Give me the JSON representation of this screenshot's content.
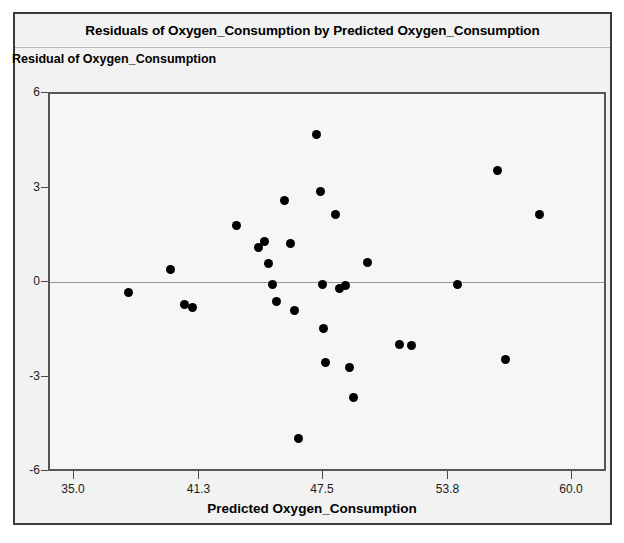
{
  "chart": {
    "title": "Residuals of Oxygen_Consumption by Predicted Oxygen_Consumption",
    "y_caption": "Residual of Oxygen_Consumption",
    "x_caption": "Predicted Oxygen_Consumption"
  },
  "chart_data": {
    "type": "scatter",
    "title": "Residuals of Oxygen_Consumption by Predicted Oxygen_Consumption",
    "xlabel": "Predicted Oxygen_Consumption",
    "ylabel": "Residual of Oxygen_Consumption",
    "xlim": [
      32.4,
      60.9
    ],
    "ylim": [
      -6,
      6
    ],
    "xticks": [
      "35.0",
      "41.3",
      "47.5",
      "53.8",
      "60.0"
    ],
    "xtick_values": [
      35.0,
      41.3,
      47.5,
      53.8,
      60.0
    ],
    "yticks": [
      "6",
      "3",
      "0",
      "-3",
      "-6"
    ],
    "ytick_values": [
      6,
      3,
      0,
      -3,
      -6
    ],
    "grid": false,
    "legend": false,
    "reference_line": {
      "orientation": "horizontal",
      "value": 0,
      "color": "#9a9a9a"
    },
    "marker": {
      "shape": "circle",
      "color": "#000000",
      "size": 9
    },
    "points": [
      {
        "x": 37.8,
        "y": -0.35
      },
      {
        "x": 39.9,
        "y": 0.35
      },
      {
        "x": 40.6,
        "y": -0.75
      },
      {
        "x": 41.0,
        "y": -0.85
      },
      {
        "x": 43.2,
        "y": 1.75
      },
      {
        "x": 44.3,
        "y": 1.05
      },
      {
        "x": 44.6,
        "y": 1.25
      },
      {
        "x": 44.8,
        "y": 0.55
      },
      {
        "x": 45.0,
        "y": -0.1
      },
      {
        "x": 45.2,
        "y": -0.65
      },
      {
        "x": 45.6,
        "y": 2.55
      },
      {
        "x": 45.9,
        "y": 1.2
      },
      {
        "x": 46.1,
        "y": -0.95
      },
      {
        "x": 46.3,
        "y": -5.0
      },
      {
        "x": 47.2,
        "y": 4.65
      },
      {
        "x": 47.4,
        "y": 2.85
      },
      {
        "x": 47.5,
        "y": -0.1
      },
      {
        "x": 47.6,
        "y": -1.5
      },
      {
        "x": 47.7,
        "y": -2.6
      },
      {
        "x": 48.2,
        "y": 2.1
      },
      {
        "x": 48.4,
        "y": -0.25
      },
      {
        "x": 48.7,
        "y": -0.15
      },
      {
        "x": 48.9,
        "y": -2.75
      },
      {
        "x": 49.1,
        "y": -3.7
      },
      {
        "x": 49.8,
        "y": 0.6
      },
      {
        "x": 51.4,
        "y": -2.0
      },
      {
        "x": 52.0,
        "y": -2.05
      },
      {
        "x": 54.3,
        "y": -0.1
      },
      {
        "x": 56.3,
        "y": 3.5
      },
      {
        "x": 56.7,
        "y": -2.5
      },
      {
        "x": 58.4,
        "y": 2.1
      }
    ]
  }
}
